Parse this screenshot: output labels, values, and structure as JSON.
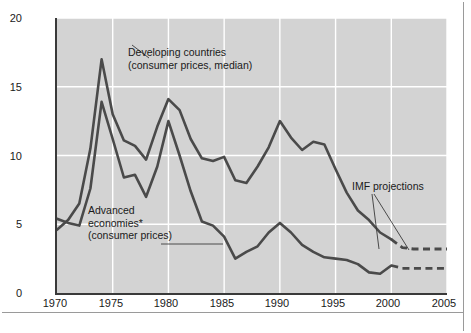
{
  "chart_data": {
    "type": "line",
    "title": "",
    "xlabel": "",
    "ylabel": "Percent inflation",
    "xlim": [
      1970,
      2005
    ],
    "ylim": [
      0,
      20
    ],
    "xticks": [
      "1970",
      "1975",
      "1980",
      "1985",
      "1990",
      "1995",
      "2000",
      "2005"
    ],
    "yticks": [
      "0",
      "5",
      "10",
      "15",
      "20"
    ],
    "grid": "white gridlines on gray panel",
    "legend": "annotations with leader lines",
    "line_color": "#4a4a4a",
    "panel_color": "#d3d3d3",
    "projection_note": "Dashed segments from 2001 onward are IMF projections",
    "series": [
      {
        "name": "Developing countries (consumer prices, median)",
        "x": [
          1970,
          1971,
          1972,
          1973,
          1974,
          1975,
          1976,
          1977,
          1978,
          1979,
          1980,
          1981,
          1982,
          1983,
          1984,
          1985,
          1986,
          1987,
          1988,
          1989,
          1990,
          1991,
          1992,
          1993,
          1994,
          1995,
          1996,
          1997,
          1998,
          1999,
          2000
        ],
        "values": [
          4.6,
          5.3,
          6.5,
          10.5,
          17.0,
          13.0,
          11.1,
          10.7,
          9.7,
          12.1,
          14.1,
          13.3,
          11.2,
          9.8,
          9.6,
          9.9,
          8.2,
          8.0,
          9.2,
          10.6,
          12.5,
          11.3,
          10.4,
          11.0,
          10.8,
          9.0,
          7.3,
          6.0,
          5.3,
          4.4,
          3.9
        ],
        "projection_x": [
          2000,
          2001,
          2002,
          2003,
          2004,
          2005
        ],
        "projection_values": [
          3.9,
          3.3,
          3.2,
          3.2,
          3.2,
          3.2
        ]
      },
      {
        "name": "Advanced economies* (consumer prices)",
        "x": [
          1970,
          1971,
          1972,
          1973,
          1974,
          1975,
          1976,
          1977,
          1978,
          1979,
          1980,
          1981,
          1982,
          1983,
          1984,
          1985,
          1986,
          1987,
          1988,
          1989,
          1990,
          1991,
          1992,
          1993,
          1994,
          1995,
          1996,
          1997,
          1998,
          1999,
          2000
        ],
        "values": [
          5.4,
          5.1,
          4.9,
          7.6,
          13.9,
          11.2,
          8.4,
          8.6,
          7.0,
          9.2,
          12.5,
          10.0,
          7.4,
          5.2,
          4.9,
          4.1,
          2.5,
          3.0,
          3.4,
          4.4,
          5.1,
          4.4,
          3.5,
          3.0,
          2.6,
          2.5,
          2.4,
          2.1,
          1.5,
          1.4,
          2.0
        ],
        "projection_x": [
          2000,
          2001,
          2002,
          2003,
          2004,
          2005
        ],
        "projection_values": [
          2.0,
          1.8,
          1.8,
          1.8,
          1.8,
          1.8
        ]
      }
    ],
    "annotations": [
      {
        "id": "developing",
        "lines": [
          "Developing countries",
          "(consumer prices, median)"
        ],
        "leader": "line from text to the 1974 peak of the developing countries series"
      },
      {
        "id": "advanced",
        "lines": [
          "Advanced",
          "economies*",
          "(consumer prices)"
        ],
        "leader": "line from text to the advanced economies series near 1986"
      },
      {
        "id": "imf",
        "lines": [
          "IMF projections"
        ],
        "leader": "two lines from text to the dashed projection segments"
      }
    ]
  }
}
